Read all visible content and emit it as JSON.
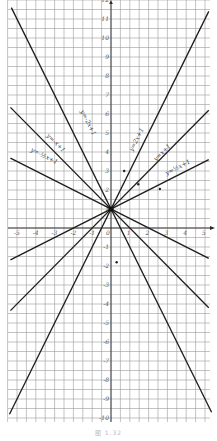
{
  "figure": {
    "caption": "图 1.32",
    "background": "#ffffff",
    "grid_color": "#9a9a9a",
    "line_color": "#1c1c1c"
  },
  "chart_data": {
    "type": "line",
    "title": "",
    "xlabel": "x",
    "ylabel": "y",
    "xlim": [
      -5.4,
      5.3
    ],
    "ylim": [
      -10.3,
      12
    ],
    "grid": true,
    "grid_step": 0.5,
    "x_ticks": [
      -5,
      -4,
      -3,
      -2,
      -1,
      0,
      1,
      2,
      3,
      4,
      5
    ],
    "y_ticks": [
      -10,
      -9,
      -8,
      -7,
      -6,
      -5,
      -4,
      -3,
      -2,
      -1,
      1,
      2,
      3,
      4,
      5,
      6,
      7,
      8,
      9,
      10,
      11,
      12
    ],
    "series": [
      {
        "name": "y=2x+1",
        "label": "y=2x+1",
        "slope": 2,
        "intercept": 1,
        "x": [
          -5.4,
          5.2
        ],
        "label_pos": [
          1.45,
          4.6
        ],
        "label_angle": -63
      },
      {
        "name": "y=-2x+1",
        "label": "y=-2x+1",
        "slope": -2,
        "intercept": 1,
        "x": [
          -5.3,
          5.35
        ],
        "label_pos": [
          -1.3,
          5.5
        ],
        "label_angle": 63
      },
      {
        "name": "y=x+1",
        "label": "y=x+1",
        "slope": 1,
        "intercept": 1,
        "x": [
          -5.35,
          5.2
        ],
        "label_pos": [
          2.8,
          3.9
        ],
        "label_angle": -45
      },
      {
        "name": "y=-x+1",
        "label": "y=-x+1",
        "slope": -1,
        "intercept": 1,
        "x": [
          -5.35,
          5.2
        ],
        "label_pos": [
          -3.0,
          4.4
        ],
        "label_angle": 45
      },
      {
        "name": "y=1/2x+1",
        "label": "y=½x+1",
        "slope": 0.5,
        "intercept": 1,
        "x": [
          -5.35,
          5.2
        ],
        "label_pos": [
          3.6,
          3.1
        ],
        "label_angle": -27
      },
      {
        "name": "y=-1/2x+1",
        "label": "y=-½x+1",
        "slope": -0.5,
        "intercept": 1,
        "x": [
          -5.35,
          5.2
        ],
        "label_pos": [
          -3.6,
          3.7
        ],
        "label_angle": 27
      }
    ],
    "intersection": {
      "x": 0,
      "y": 1
    },
    "points": [
      {
        "x": 0.7,
        "y": 3.0
      },
      {
        "x": 1.45,
        "y": 2.3
      },
      {
        "x": 2.6,
        "y": 2.05
      },
      {
        "x": 0.3,
        "y": -1.8
      }
    ]
  }
}
